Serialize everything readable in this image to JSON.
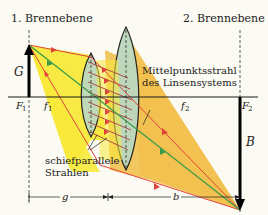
{
  "labels": {
    "focal_plane_1": "1. Brennebene",
    "focal_plane_2": "2. Brennebene",
    "object": "G",
    "image": "B",
    "focus_1": "F",
    "focus_1_sub": "1",
    "focus_2": "F",
    "focus_2_sub": "2",
    "focal_length_1": "f",
    "focal_length_1_sub": "1",
    "focal_length_2": "f",
    "focal_length_2_sub": "2",
    "chief_ray_line1": "Mittelpunktsstrahl",
    "chief_ray_line2": "des Linsensystems",
    "oblique_rays_line1": "schiefparallele",
    "oblique_rays_line2": "Strahlen",
    "object_distance": "g",
    "image_distance": "b"
  },
  "colors": {
    "background": "#fbfaf3",
    "yellow_beam": "#f7e93a",
    "orange_beam": "#f2c14f",
    "lens_fill": "#bcd8bf",
    "ray_red": "#e0433a",
    "ray_green": "#3a9a4a",
    "ray_hatch": "#b04a4a",
    "axis": "#1a1a1a"
  }
}
